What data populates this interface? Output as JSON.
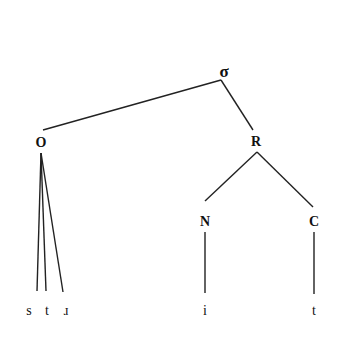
{
  "diagram": {
    "type": "syllable-tree",
    "root": {
      "label": "σ",
      "x": 224,
      "y": 71
    },
    "nodes": [
      {
        "id": "onset",
        "label": "O",
        "x": 41,
        "y": 143
      },
      {
        "id": "rime",
        "label": "R",
        "x": 256,
        "y": 142
      },
      {
        "id": "nucleus",
        "label": "N",
        "x": 205,
        "y": 222
      },
      {
        "id": "coda",
        "label": "C",
        "x": 314,
        "y": 222
      }
    ],
    "leaves": [
      {
        "label": "s",
        "x": 29,
        "y": 311
      },
      {
        "label": "t",
        "x": 47,
        "y": 311
      },
      {
        "label": "ɹ",
        "x": 66,
        "y": 311
      },
      {
        "label": "i",
        "x": 205,
        "y": 311
      },
      {
        "label": "t",
        "x": 314,
        "y": 311
      }
    ],
    "edges": [
      {
        "from": "σ",
        "to": "O",
        "x1": 221,
        "y1": 80,
        "x2": 43,
        "y2": 130
      },
      {
        "from": "σ",
        "to": "R",
        "x1": 221,
        "y1": 80,
        "x2": 253,
        "y2": 130
      },
      {
        "from": "O",
        "to": "s",
        "x1": 41,
        "y1": 153,
        "x2": 37,
        "y2": 291
      },
      {
        "from": "O",
        "to": "t",
        "x1": 41,
        "y1": 153,
        "x2": 46,
        "y2": 291
      },
      {
        "from": "O",
        "to": "ɹ",
        "x1": 41,
        "y1": 153,
        "x2": 63,
        "y2": 292
      },
      {
        "from": "R",
        "to": "N",
        "x1": 257,
        "y1": 152,
        "x2": 205,
        "y2": 201
      },
      {
        "from": "R",
        "to": "C",
        "x1": 257,
        "y1": 152,
        "x2": 313,
        "y2": 207
      },
      {
        "from": "N",
        "to": "i",
        "x1": 205,
        "y1": 232,
        "x2": 205,
        "y2": 293
      },
      {
        "from": "C",
        "to": "t",
        "x1": 314,
        "y1": 232,
        "x2": 314,
        "y2": 294
      }
    ],
    "line_color": "#222222"
  }
}
